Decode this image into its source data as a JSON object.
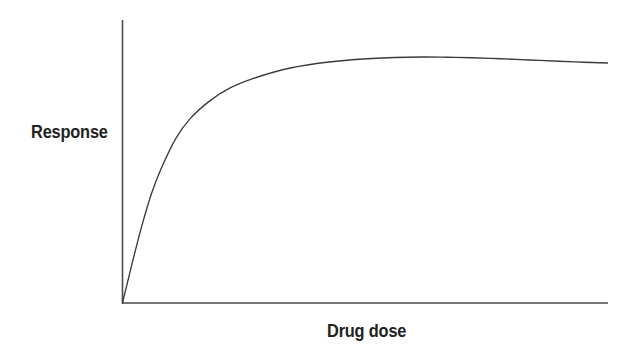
{
  "figure": {
    "background_color": "#ffffff",
    "line_color": "#3b3b3b",
    "axis_color": "#4a4a4a",
    "text_color": "#222222"
  },
  "chart_data": {
    "type": "line",
    "title": "",
    "xlabel": "Drug dose",
    "ylabel": "Response",
    "grid": false,
    "legend": null,
    "annotations": [],
    "xlim": [
      0,
      100
    ],
    "ylim": [
      0,
      100
    ],
    "x_tick_labels": [],
    "y_tick_labels": [],
    "axis_arrowheads": false,
    "series": [
      {
        "name": "Response vs drug dose",
        "x": [
          0,
          2,
          4,
          6,
          8,
          11,
          14,
          18,
          22,
          27,
          33,
          40,
          48,
          56,
          62,
          67,
          72,
          78,
          84,
          90,
          95,
          100
        ],
        "values": [
          0,
          16,
          31,
          44,
          54,
          66,
          74,
          81,
          86,
          90,
          93.5,
          96,
          97.6,
          98.4,
          98.6,
          98.5,
          98.3,
          97.9,
          97.4,
          96.9,
          96.5,
          96.2
        ]
      }
    ]
  },
  "labels": {
    "y_axis": "Response",
    "x_axis": "Drug dose"
  }
}
